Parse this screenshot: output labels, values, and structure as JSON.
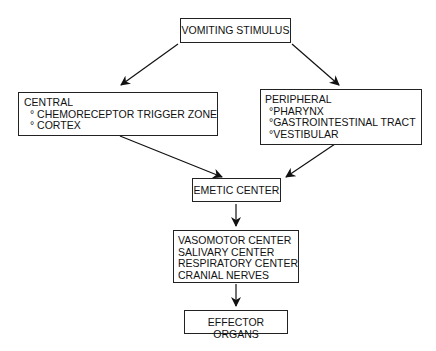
{
  "diagram": {
    "nodes": {
      "stimulus": {
        "label": "VOMITING STIMULUS"
      },
      "central": {
        "title": "CENTRAL",
        "items": [
          "° CHEMORECEPTOR TRIGGER ZONE",
          "° CORTEX"
        ]
      },
      "peripheral": {
        "title": "PERIPHERAL",
        "items": [
          "°PHARYNX",
          "°GASTROINTESTINAL TRACT",
          "°VESTIBULAR"
        ]
      },
      "emetic": {
        "label": "EMETIC CENTER"
      },
      "centers": {
        "items": [
          "VASOMOTOR CENTER",
          "SALIVARY CENTER",
          "RESPIRATORY CENTER",
          "CRANIAL NERVES"
        ]
      },
      "effector": {
        "label": "EFFECTOR ORGANS"
      }
    },
    "edges": [
      {
        "from": "VOMITING STIMULUS",
        "to": "CENTRAL"
      },
      {
        "from": "VOMITING STIMULUS",
        "to": "PERIPHERAL"
      },
      {
        "from": "CENTRAL",
        "to": "EMETIC CENTER"
      },
      {
        "from": "PERIPHERAL",
        "to": "EMETIC CENTER"
      },
      {
        "from": "EMETIC CENTER",
        "to": "VASOMOTOR / SALIVARY / RESPIRATORY CENTERS, CRANIAL NERVES"
      },
      {
        "from": "VASOMOTOR / SALIVARY / RESPIRATORY CENTERS, CRANIAL NERVES",
        "to": "EFFECTOR ORGANS"
      }
    ]
  }
}
